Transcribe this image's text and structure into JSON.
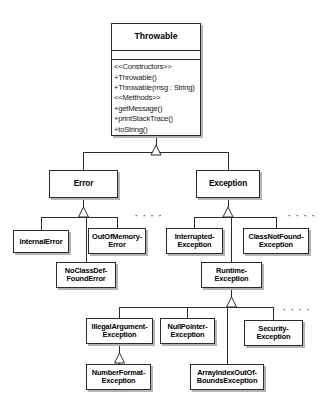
{
  "diagram": {
    "kind": "uml-class-hierarchy",
    "background_color": "#ffffff",
    "line_color": "#2b2b2b",
    "box_fill": "#ffffff",
    "shadow_color": "#b4b4b4"
  },
  "root": {
    "id": "throwable",
    "name": "Throwable",
    "attributes": [],
    "operations": [
      "<<Constructors>>",
      "+Throwable()",
      "+Throwable(msg : String)",
      "<<Metthods>>",
      "+getMessage()",
      "+printStackTrace()",
      "+toString()"
    ],
    "x": 111,
    "y": 23,
    "w": 90,
    "h": 113
  },
  "nodes": [
    {
      "id": "error",
      "name": "Error",
      "x": 49,
      "y": 170,
      "w": 69,
      "h": 28,
      "size": "mid"
    },
    {
      "id": "exception",
      "name": "Exception",
      "x": 196,
      "y": 170,
      "w": 64,
      "h": 28,
      "size": "mid"
    },
    {
      "id": "internal-error",
      "name": "InternalError",
      "x": 13,
      "y": 230,
      "w": 56,
      "h": 23,
      "size": "leaf"
    },
    {
      "id": "out-of-memory-error",
      "name": "OutOfMemory-\nError",
      "x": 88,
      "y": 228,
      "w": 58,
      "h": 26,
      "size": "leaf"
    },
    {
      "id": "interrupted-exception",
      "name": "Interrupted-\nException",
      "x": 166,
      "y": 228,
      "w": 57,
      "h": 26,
      "size": "leaf"
    },
    {
      "id": "class-not-found-exception",
      "name": "ClassNotFound-\nException",
      "x": 243,
      "y": 228,
      "w": 66,
      "h": 26,
      "size": "leaf"
    },
    {
      "id": "no-class-def-found-error",
      "name": "NoClassDef-\nFoundError",
      "x": 56,
      "y": 262,
      "w": 60,
      "h": 26,
      "size": "leaf"
    },
    {
      "id": "runtime-exception",
      "name": "Runtime-\nException",
      "x": 201,
      "y": 262,
      "w": 61,
      "h": 26,
      "size": "leaf"
    },
    {
      "id": "illegal-argument-exception",
      "name": "IllegalArgument-\nException",
      "x": 86,
      "y": 318,
      "w": 67,
      "h": 26,
      "size": "leaf"
    },
    {
      "id": "null-pointer-exception",
      "name": "NullPointer-\nException",
      "x": 160,
      "y": 318,
      "w": 55,
      "h": 26,
      "size": "leaf"
    },
    {
      "id": "security-exception",
      "name": "Security-\nException",
      "x": 244,
      "y": 320,
      "w": 59,
      "h": 26,
      "size": "leaf"
    },
    {
      "id": "number-format-exception",
      "name": "NumberFormat-\nException",
      "x": 86,
      "y": 364,
      "w": 65,
      "h": 26,
      "size": "leaf"
    },
    {
      "id": "array-index-out-of-bounds-exception",
      "name": "ArrayIndexOutOf-\nBoundsException",
      "x": 190,
      "y": 364,
      "w": 74,
      "h": 26,
      "size": "leaf"
    }
  ],
  "ellipses": [
    {
      "id": "error-more",
      "label": "· · · ·",
      "x": 135,
      "y": 212
    },
    {
      "id": "exception-more",
      "label": "· · · ·",
      "x": 288,
      "y": 212
    },
    {
      "id": "runtime-more",
      "label": "· · · ·",
      "x": 283,
      "y": 306
    }
  ],
  "edges": [
    {
      "from": "throwable",
      "to": "error",
      "type": "generalization"
    },
    {
      "from": "throwable",
      "to": "exception",
      "type": "generalization"
    },
    {
      "from": "error",
      "to": "internal-error",
      "type": "generalization"
    },
    {
      "from": "error",
      "to": "out-of-memory-error",
      "type": "generalization"
    },
    {
      "from": "error",
      "to": "no-class-def-found-error",
      "type": "generalization"
    },
    {
      "from": "exception",
      "to": "interrupted-exception",
      "type": "generalization"
    },
    {
      "from": "exception",
      "to": "class-not-found-exception",
      "type": "generalization"
    },
    {
      "from": "exception",
      "to": "runtime-exception",
      "type": "generalization"
    },
    {
      "from": "runtime-exception",
      "to": "illegal-argument-exception",
      "type": "generalization"
    },
    {
      "from": "runtime-exception",
      "to": "null-pointer-exception",
      "type": "generalization"
    },
    {
      "from": "runtime-exception",
      "to": "security-exception",
      "type": "generalization"
    },
    {
      "from": "runtime-exception",
      "to": "array-index-out-of-bounds-exception",
      "type": "generalization"
    },
    {
      "from": "illegal-argument-exception",
      "to": "number-format-exception",
      "type": "generalization"
    }
  ]
}
